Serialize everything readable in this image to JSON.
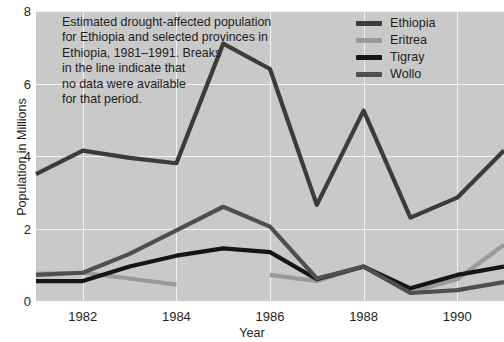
{
  "chart_data": {
    "type": "line",
    "title": "",
    "annotation": [
      "Estimated drought-affected population",
      "for Ethiopia and selected provinces in",
      "Ethiopia, 1981–1991. Breaks",
      "in the line indicate that",
      "no data were available",
      "for that period."
    ],
    "xlabel": "Year",
    "ylabel": "Population in Millions",
    "xlim": [
      1981,
      1991
    ],
    "ylim": [
      0,
      8
    ],
    "xticks": [
      1982,
      1984,
      1986,
      1988,
      1990
    ],
    "xtick_labels": [
      "1982",
      "1984",
      "1986",
      "1988",
      "1990"
    ],
    "yticks": [
      0,
      2,
      4,
      6,
      8
    ],
    "ytick_labels": [
      "0",
      "2",
      "4",
      "6",
      "8"
    ],
    "grid": true,
    "legend_position": "top-right",
    "plot_background": "#c9c9c9",
    "grid_color": "#f2f2f2",
    "x": [
      1981,
      1982,
      1983,
      1984,
      1985,
      1986,
      1987,
      1988,
      1989,
      1990,
      1991
    ],
    "series": [
      {
        "name": "Ethiopia",
        "color": "#3b3b3b",
        "values": [
          3.5,
          4.15,
          3.95,
          3.8,
          7.1,
          6.4,
          2.65,
          5.25,
          2.3,
          2.85,
          4.15
        ]
      },
      {
        "name": "Eritrea",
        "color": "#9a9a9a",
        "values": [
          0.75,
          0.78,
          0.62,
          0.45,
          null,
          0.72,
          0.55,
          0.95,
          0.25,
          0.6,
          1.55
        ]
      },
      {
        "name": "Tigray",
        "color": "#151515",
        "values": [
          0.55,
          0.55,
          0.95,
          1.25,
          1.45,
          1.35,
          0.6,
          0.95,
          0.35,
          0.72,
          0.95
        ]
      },
      {
        "name": "Wollo",
        "color": "#4f4f4f",
        "values": [
          0.72,
          0.78,
          1.3,
          1.95,
          2.6,
          2.05,
          0.62,
          0.95,
          0.22,
          0.3,
          0.52
        ]
      }
    ]
  },
  "legend": {
    "entries": [
      {
        "label": "Ethiopia",
        "color": "#3b3b3b"
      },
      {
        "label": "Eritrea",
        "color": "#9a9a9a"
      },
      {
        "label": "Tigray",
        "color": "#151515"
      },
      {
        "label": "Wollo",
        "color": "#4f4f4f"
      }
    ]
  }
}
